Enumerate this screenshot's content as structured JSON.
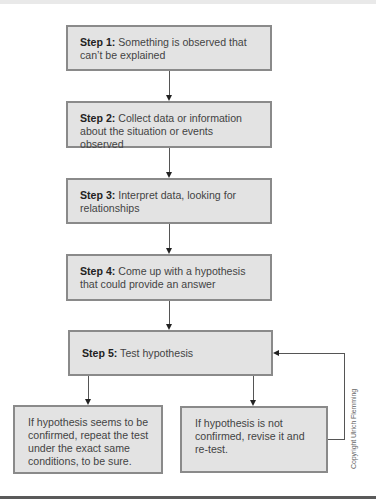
{
  "diagram": {
    "type": "flowchart",
    "steps": [
      {
        "label": "Step 1:",
        "text": " Something is observed that can’t be explained"
      },
      {
        "label": "Step 2:",
        "text": " Collect data or information about the situation or events observed"
      },
      {
        "label": "Step 3:",
        "text": " Interpret data, looking for relationships"
      },
      {
        "label": "Step 4:",
        "text": " Come up with a hypothesis that could provide an answer"
      },
      {
        "label": "Step 5:",
        "text": " Test hypothesis"
      }
    ],
    "outcomes": [
      {
        "text": "If hypothesis seems to be confirmed, repeat the test under the exact same conditions, to be sure."
      },
      {
        "text": "If hypothesis is not confirmed, revise it and re-test."
      }
    ],
    "copyright": "Copyright Ulrich Flemming"
  },
  "colors": {
    "box_fill": "#e3e3e3",
    "box_border": "#8a8a8a",
    "connector": "#555555",
    "arrowhead": "#222222"
  }
}
